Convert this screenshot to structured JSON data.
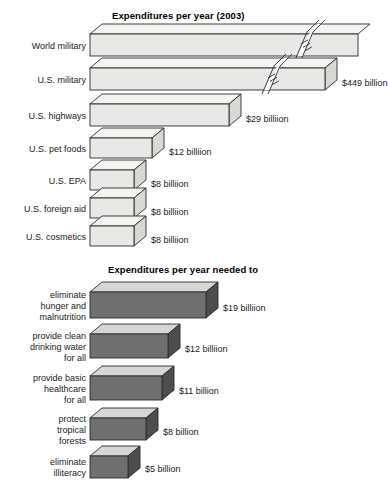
{
  "sections": [
    {
      "id": "expenditures-actual",
      "title": "Expenditures per year (2003)",
      "fill": "#e8e8e6",
      "top_fill": "#f4f4f2",
      "side_fill": "#d8d8d5",
      "rows": [
        {
          "label": "World military",
          "value_label": "",
          "value": 956,
          "truncated": true,
          "break": true
        },
        {
          "label": "U.S. military",
          "value_label": "$449 billion",
          "value": 449,
          "truncated": false,
          "break": true
        },
        {
          "label": "U.S. highways",
          "value_label": "$29 billiion",
          "value": 29,
          "truncated": false,
          "break": false
        },
        {
          "label": "U.S. pet foods",
          "value_label": "$12 billiion",
          "value": 12,
          "truncated": false,
          "break": false
        },
        {
          "label": "U.S. EPA",
          "value_label": "$8 billiion",
          "value": 8,
          "truncated": false,
          "break": false
        },
        {
          "label": "U.S. foreign aid",
          "value_label": "$8 billiion",
          "value": 8,
          "truncated": false,
          "break": false
        },
        {
          "label": "U.S. cosmetics",
          "value_label": "$8 billiion",
          "value": 8,
          "truncated": false,
          "break": false
        }
      ]
    },
    {
      "id": "expenditures-needed",
      "title": "Expenditures per year needed to",
      "fill": "#6f6f6f",
      "top_fill": "#d6d6d4",
      "side_fill": "#4d4d4d",
      "rows": [
        {
          "label": "eliminate\nhunger and\nmalnutrition",
          "value_label": "$19 billiion",
          "value": 19,
          "truncated": false,
          "break": false
        },
        {
          "label": "provide clean\ndrinking water\nfor all",
          "value_label": "$12 billiion",
          "value": 12,
          "truncated": false,
          "break": false
        },
        {
          "label": "provide basic\nhealthcare\nfor all",
          "value_label": "$11 billion",
          "value": 11,
          "truncated": false,
          "break": false
        },
        {
          "label": "protect\ntropical\nforests",
          "value_label": "$8 billion",
          "value": 8,
          "truncated": false,
          "break": false
        },
        {
          "label": "eliminate\nilliteracy",
          "value_label": "$5 billion",
          "value": 5,
          "truncated": false,
          "break": false
        }
      ]
    }
  ],
  "chart_data": {
    "type": "bar",
    "xlabel": "",
    "ylabel": "",
    "units": "billions of US dollars",
    "note": "Horizontal 3-D bar chart; the two longest bars are drawn with break marks because they run off scale.",
    "panels": [
      {
        "title": "Expenditures per year (2003)",
        "categories": [
          "World military",
          "U.S. military",
          "U.S. highways",
          "U.S. pet foods",
          "U.S. EPA",
          "U.S. foreign aid",
          "U.S. cosmetics"
        ],
        "values": [
          956,
          449,
          29,
          12,
          8,
          8,
          8
        ],
        "value_labels": [
          "",
          "$449 billion",
          "$29 billiion",
          "$12 billiion",
          "$8 billiion",
          "$8 billiion",
          "$8 billiion"
        ],
        "bar_style": "light-gray 3D",
        "axis_break": [
          "World military",
          "U.S. military"
        ]
      },
      {
        "title": "Expenditures per year needed to",
        "categories": [
          "eliminate hunger and malnutrition",
          "provide clean drinking water for all",
          "provide basic healthcare for all",
          "protect tropical forests",
          "eliminate illiteracy"
        ],
        "values": [
          19,
          12,
          11,
          8,
          5
        ],
        "value_labels": [
          "$19 billiion",
          "$12 billiion",
          "$11 billion",
          "$8 billion",
          "$5 billion"
        ],
        "bar_style": "dark-gray 3D",
        "axis_break": []
      }
    ],
    "grid": false,
    "legend": "none"
  }
}
